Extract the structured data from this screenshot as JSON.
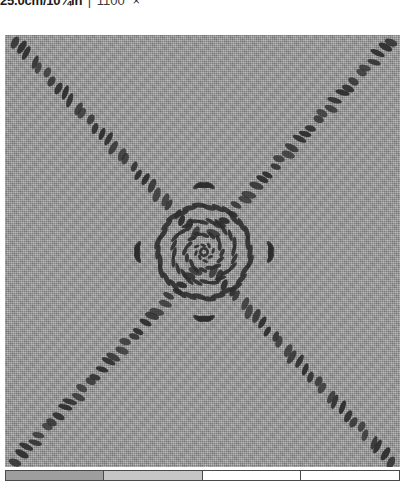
{
  "caption": {
    "dimension": "25.0cm/10¾in",
    "separator": "|",
    "code": "1100",
    "close_label": "×"
  },
  "photo": {
    "alt_name": "embroidered-linen-sampler",
    "fabric_color": "#9b9b9b",
    "stitch_color": "#2e2e2e",
    "motif": "cross-and-central-rosette",
    "plate_width": 395,
    "plate_height": 432
  },
  "stitching": {
    "arms": [
      {
        "name": "arm-top-left",
        "x1": 10,
        "y1": 6,
        "x2": 190,
        "y2": 198,
        "count": 30
      },
      {
        "name": "arm-top-right",
        "x1": 386,
        "y1": 6,
        "x2": 208,
        "y2": 198,
        "count": 30
      },
      {
        "name": "arm-bottom-left",
        "x1": 10,
        "y1": 426,
        "x2": 190,
        "y2": 236,
        "count": 30
      },
      {
        "name": "arm-bottom-right",
        "x1": 386,
        "y1": 426,
        "x2": 208,
        "y2": 236,
        "count": 30
      }
    ],
    "rosette": {
      "center_x": 199,
      "center_y": 217,
      "rings": [
        {
          "name": "outer-ring",
          "radius": 46,
          "count": 30,
          "len": 15,
          "wid": 5
        },
        {
          "name": "middle-ring",
          "radius": 31,
          "count": 24,
          "len": 12,
          "wid": 4
        },
        {
          "name": "inner-ring",
          "radius": 18,
          "count": 16,
          "len": 9,
          "wid": 4
        },
        {
          "name": "core-ring",
          "radius": 8,
          "count": 8,
          "len": 6,
          "wid": 3
        }
      ]
    },
    "corner_flares": [
      {
        "name": "flare-top",
        "cx": 199,
        "cy": 160,
        "count": 7
      },
      {
        "name": "flare-bottom",
        "cx": 199,
        "cy": 274,
        "count": 7
      },
      {
        "name": "flare-left",
        "cx": 142,
        "cy": 217,
        "count": 7
      },
      {
        "name": "flare-right",
        "cx": 256,
        "cy": 217,
        "count": 7
      }
    ]
  },
  "swatch_strip": {
    "name": "color-scale-strip",
    "cells": [
      {
        "label": "",
        "color": "#9e9e9e",
        "width_pct": 25
      },
      {
        "label": "",
        "color": "#c6c6c6",
        "width_pct": 25
      },
      {
        "label": "",
        "color": "#ffffff",
        "width_pct": 25
      },
      {
        "label": "",
        "color": "#ffffff",
        "width_pct": 25
      }
    ]
  }
}
